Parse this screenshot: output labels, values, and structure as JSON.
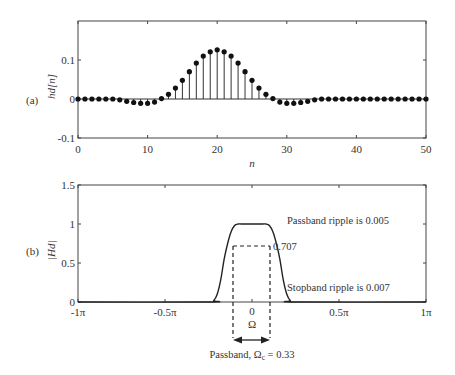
{
  "chart_data": [
    {
      "type": "stem",
      "panel_label": "(a)",
      "title": "",
      "xlabel": "n",
      "ylabel": "hd[n]",
      "xlim": [
        0,
        50
      ],
      "ylim": [
        -0.1,
        0.2
      ],
      "xticks": [
        "0",
        "10",
        "20",
        "30",
        "40",
        "50"
      ],
      "yticks": [
        "-0.1",
        "0",
        "0.1"
      ],
      "grid": false,
      "x": [
        0,
        1,
        2,
        3,
        4,
        5,
        6,
        7,
        8,
        9,
        10,
        11,
        12,
        13,
        14,
        15,
        16,
        17,
        18,
        19,
        20,
        21,
        22,
        23,
        24,
        25,
        26,
        27,
        28,
        29,
        30,
        31,
        32,
        33,
        34,
        35,
        36,
        37,
        38,
        39,
        40,
        41,
        42,
        43,
        44,
        45,
        46,
        47,
        48,
        49,
        50
      ],
      "values": [
        0,
        0,
        0,
        0,
        0,
        0,
        -0.002,
        -0.006,
        -0.009,
        -0.011,
        -0.011,
        -0.008,
        0.001,
        0.012,
        0.028,
        0.048,
        0.07,
        0.092,
        0.11,
        0.121,
        0.126,
        0.121,
        0.11,
        0.092,
        0.07,
        0.048,
        0.028,
        0.012,
        0.001,
        -0.008,
        -0.011,
        -0.011,
        -0.009,
        -0.006,
        -0.002,
        0,
        0,
        0,
        0,
        0,
        0,
        0,
        0,
        0,
        0,
        0,
        0,
        0,
        0,
        0,
        0
      ]
    },
    {
      "type": "line",
      "panel_label": "(b)",
      "title": "",
      "xlabel": "Ω",
      "ylabel": "|Hd|",
      "xlim": [
        -1,
        1
      ],
      "ylim": [
        0,
        1.5
      ],
      "xticks": [
        "-1π",
        "-0.5π",
        "0",
        "0.5π",
        "1π"
      ],
      "yticks": [
        "0",
        "0.5",
        "1",
        "1.5"
      ],
      "grid": false,
      "x": [
        -1.0,
        -0.25,
        -0.22,
        -0.2,
        -0.18,
        -0.16,
        -0.14,
        -0.12,
        -0.1,
        -0.08,
        -0.05,
        0,
        0.05,
        0.08,
        0.1,
        0.12,
        0.14,
        0.16,
        0.18,
        0.2,
        0.22,
        0.25,
        1.0
      ],
      "values": [
        0,
        0,
        0.02,
        0.1,
        0.28,
        0.55,
        0.75,
        0.9,
        0.98,
        1.0,
        1.0,
        1.0,
        1.0,
        1.0,
        0.98,
        0.9,
        0.75,
        0.55,
        0.28,
        0.1,
        0.02,
        0,
        0
      ],
      "annotations": [
        {
          "text": "Passband ripple is 0.005"
        },
        {
          "text": "0.707"
        },
        {
          "text": "Stopband ripple is 0.007"
        },
        {
          "text": "Passband, Ωc = 0.33"
        }
      ],
      "cutoff_level": 0.707,
      "cutoff_band": [
        -0.165,
        0.165
      ]
    }
  ],
  "labels": {
    "panel_a": "(a)",
    "panel_b": "(b)",
    "a_ylabel_main": "hd",
    "a_ylabel_arg": "[n]",
    "a_xlabel": "n",
    "b_ylabel": "|Hd|",
    "b_zero": "0",
    "b_omega": "Ω",
    "passband_ripple": "Passband ripple is 0.005",
    "stopband_ripple": "Stopband ripple is 0.007",
    "cutoff_value": "0.707",
    "passband_prefix": "Passband, Ω",
    "passband_sub": "c",
    "passband_suffix": " = 0.33"
  }
}
